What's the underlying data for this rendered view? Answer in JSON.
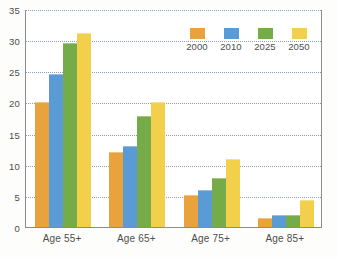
{
  "chart_data": {
    "type": "bar",
    "title": "",
    "xlabel": "",
    "ylabel": "",
    "ylim": [
      0,
      35
    ],
    "yticks": [
      0,
      5,
      10,
      15,
      20,
      25,
      30,
      35
    ],
    "grid": true,
    "legend_position": "top-right-inside",
    "categories": [
      "Age 55+",
      "Age 65+",
      "Age 75+",
      "Age 85+"
    ],
    "series": [
      {
        "name": "2000",
        "color": "#e8a33d",
        "values": [
          20.0,
          12.0,
          5.1,
          1.5
        ]
      },
      {
        "name": "2010",
        "color": "#5b9bd5",
        "values": [
          24.6,
          13.0,
          6.0,
          1.9
        ]
      },
      {
        "name": "2025",
        "color": "#76ab4a",
        "values": [
          29.5,
          17.8,
          7.8,
          2.0
        ]
      },
      {
        "name": "2050",
        "color": "#f2d04b",
        "values": [
          31.1,
          20.1,
          11.0,
          4.4
        ]
      }
    ]
  },
  "axis": {
    "y_tick_labels": [
      "0",
      "5",
      "10",
      "15",
      "20",
      "25",
      "30",
      "35"
    ]
  },
  "legend": {
    "items": [
      {
        "label": "2000"
      },
      {
        "label": "2010"
      },
      {
        "label": "2025"
      },
      {
        "label": "2050"
      }
    ]
  },
  "colors": {
    "series_2000": "#e8a33d",
    "series_2010": "#5b9bd5",
    "series_2025": "#76ab4a",
    "series_2050": "#f2d04b",
    "axis_line": "#8c8c8c",
    "gridline": "#7d8fa6",
    "tick_text": "#4d4d4d",
    "plot_background": "#ffffff"
  }
}
